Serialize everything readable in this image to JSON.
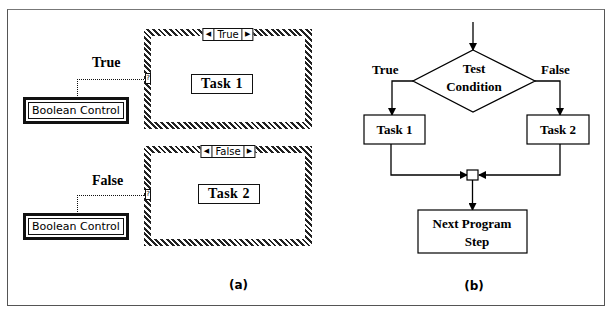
{
  "panel_a": {
    "label": "(a)",
    "true_case": {
      "wire_label": "True",
      "control_label": "Boolean Control",
      "selector_label": "True",
      "task_label": "Task 1",
      "tunnel_glyph": "?"
    },
    "false_case": {
      "wire_label": "False",
      "control_label": "Boolean Control",
      "selector_label": "False",
      "task_label": "Task 2",
      "tunnel_glyph": "?"
    },
    "selector_left_glyph": "◀",
    "selector_right_glyph": "▶"
  },
  "panel_b": {
    "label": "(b)",
    "decision": {
      "line1": "Test",
      "line2": "Condition"
    },
    "true_branch_label": "True",
    "false_branch_label": "False",
    "task1_label": "Task 1",
    "task2_label": "Task 2",
    "next_step": {
      "line1": "Next Program",
      "line2": "Step"
    }
  }
}
